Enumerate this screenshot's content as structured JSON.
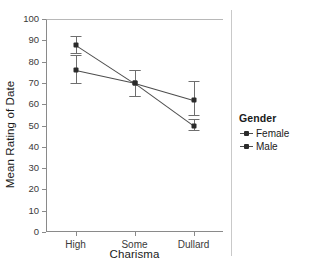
{
  "chart_data": {
    "type": "line",
    "title": "",
    "xlabel": "Charisma",
    "ylabel": "Mean Rating of Date",
    "categories": [
      "High",
      "Some",
      "Dullard"
    ],
    "ylim": [
      0,
      100
    ],
    "yticks": [
      0,
      10,
      20,
      30,
      40,
      50,
      60,
      70,
      80,
      90,
      100
    ],
    "ytick_labels": [
      "0",
      "10",
      "20",
      "30",
      "40",
      "50",
      "60",
      "70",
      "80",
      "90",
      "100"
    ],
    "grid": false,
    "legend_position": "right",
    "legend_title": "Gender",
    "error_bars": "confidence interval",
    "series": [
      {
        "name": "Female",
        "values": [
          88,
          70,
          50
        ],
        "err_low": [
          84,
          64,
          48
        ],
        "err_high": [
          92,
          76,
          53
        ]
      },
      {
        "name": "Male",
        "values": [
          76,
          70,
          62
        ],
        "err_low": [
          70,
          64,
          55
        ],
        "err_high": [
          83,
          76,
          71
        ]
      }
    ],
    "colors": {
      "line": "#4d4d4d",
      "point": "#2b2b2b",
      "error": "#6e6e6e",
      "axis": "#8a8a8a",
      "text": "#1a1a1a"
    }
  }
}
